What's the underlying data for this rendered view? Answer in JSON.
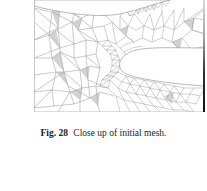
{
  "figure": {
    "colors": {
      "edge": "#9a9a9a",
      "fill_shaded": "#d0d0d0",
      "background": "#ffffff",
      "right_bar": "#111111"
    }
  },
  "caption": {
    "label": "Fig. 28",
    "text": "Close up of initial mesh."
  }
}
